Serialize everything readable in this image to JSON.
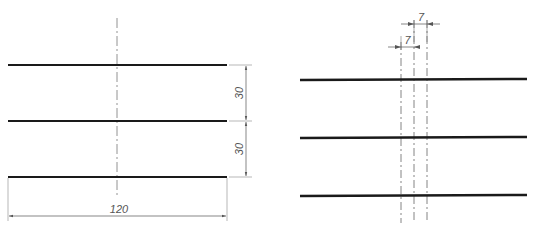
{
  "colors": {
    "object_line": "#1a1a1a",
    "center_line": "#777777",
    "dim_line": "#666666",
    "background": "#ffffff"
  },
  "left_drawing": {
    "horizontal_lines": [
      {
        "y": 65,
        "x1": 8,
        "x2": 227
      },
      {
        "y": 121,
        "x1": 8,
        "x2": 227
      },
      {
        "y": 177,
        "x1": 8,
        "x2": 227
      }
    ],
    "center_line": {
      "x": 117,
      "y1": 18,
      "y2": 198
    },
    "dimensions": {
      "vertical_top": "30",
      "vertical_bottom": "30",
      "horizontal": "120"
    }
  },
  "right_drawing": {
    "horizontal_lines": [
      {
        "y": 80,
        "x1": 300,
        "x2": 527
      },
      {
        "y": 138,
        "x1": 300,
        "x2": 527
      },
      {
        "y": 196,
        "x1": 300,
        "x2": 527
      }
    ],
    "dash_lines": [
      401,
      414,
      427
    ],
    "dimensions": {
      "top_spacing": "7",
      "lower_spacing": "7"
    }
  }
}
